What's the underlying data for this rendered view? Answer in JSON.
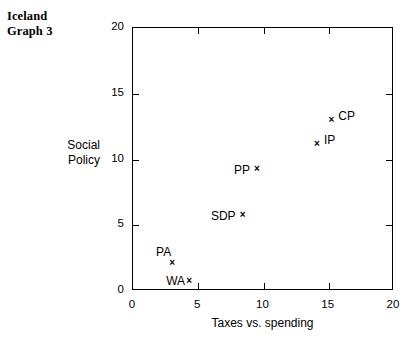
{
  "title": "Iceland\nGraph 3",
  "chart_data": {
    "type": "scatter",
    "title": "Iceland Graph 3",
    "xlabel": "Taxes vs. spending",
    "ylabel": "Social\nPolicy",
    "xlim": [
      0,
      20
    ],
    "ylim": [
      0,
      20
    ],
    "xticks": [
      "0",
      "5",
      "10",
      "15",
      "20"
    ],
    "yticks": [
      "0",
      "5",
      "10",
      "15",
      "20"
    ],
    "xtick_values": [
      0,
      5,
      10,
      15,
      20
    ],
    "ytick_values": [
      0,
      5,
      10,
      15,
      20
    ],
    "grid": false,
    "legend": "none",
    "marker": "x",
    "marker_color": "#000000",
    "points": [
      {
        "label": "CP",
        "x": 15.2,
        "y": 13.0,
        "label_pos": "right"
      },
      {
        "label": "IP",
        "x": 14.1,
        "y": 11.2,
        "label_pos": "right"
      },
      {
        "label": "PP",
        "x": 9.5,
        "y": 9.3,
        "label_pos": "left"
      },
      {
        "label": "SDP",
        "x": 8.4,
        "y": 5.8,
        "label_pos": "left"
      },
      {
        "label": "PA",
        "x": 3.0,
        "y": 2.1,
        "label_pos": "upleft"
      },
      {
        "label": "WA",
        "x": 4.3,
        "y": 0.75,
        "label_pos": "tight"
      }
    ]
  }
}
